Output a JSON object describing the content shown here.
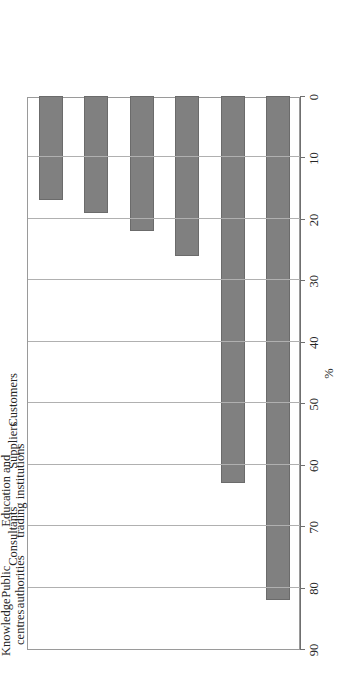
{
  "figure": {
    "orientation": "rotated-90-ccw",
    "background_color": "#ffffff",
    "bar_color": "#808080",
    "bar_edge_color": "#6b6b6b",
    "frame_color": "#9a9a9a",
    "gridline_color": "#b0b0b0",
    "axis_color": "#6f6f6f"
  },
  "chart_data": {
    "type": "bar",
    "title": "",
    "subtitle": "",
    "orientation": "horizontal",
    "categories": [
      "Customers",
      "Suppliers",
      "Education and\ntrading institutions",
      "Consultants",
      "Public\nauthorities",
      "Knowledge\ncentres"
    ],
    "values": [
      82,
      63,
      26,
      22,
      19,
      17
    ],
    "xlabel": "",
    "ylabel": "%",
    "value_axis_label": "%",
    "ylim": [
      0,
      90
    ],
    "value_ticks": [
      90,
      80,
      70,
      60,
      50,
      40,
      30,
      20,
      10,
      0
    ],
    "tick_labels": [
      "90",
      "80",
      "70",
      "60",
      "50",
      "40",
      "30",
      "20",
      "10",
      "0"
    ],
    "axis_direction": "reversed",
    "grid": true,
    "grid_axis": "value",
    "legend": false,
    "legend_position": "none",
    "series": [
      {
        "name": "",
        "values": [
          82,
          63,
          26,
          22,
          19,
          17
        ]
      }
    ],
    "annotations": []
  }
}
